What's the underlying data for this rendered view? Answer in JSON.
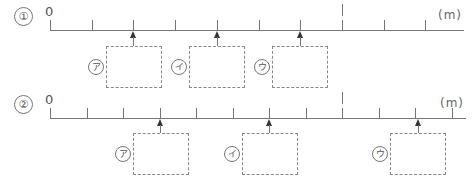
{
  "problems": [
    {
      "number": "①",
      "zero_label": "0",
      "unit": "(m)",
      "axis": {
        "x_start": 50,
        "x_end": 464,
        "y": 30
      },
      "ticks": [
        50,
        92,
        133,
        175,
        217,
        259,
        300,
        342,
        384,
        425
      ],
      "major_tick": 342,
      "blanks": [
        {
          "label": "ア",
          "arrow_x": 133,
          "box": {
            "x": 106,
            "y": 46,
            "w": 56,
            "h": 42
          },
          "label_x": 88
        },
        {
          "label": "イ",
          "arrow_x": 217,
          "box": {
            "x": 189,
            "y": 46,
            "w": 56,
            "h": 42
          },
          "label_x": 171
        },
        {
          "label": "ウ",
          "arrow_x": 300,
          "box": {
            "x": 272,
            "y": 46,
            "w": 56,
            "h": 42
          },
          "label_x": 254
        }
      ]
    },
    {
      "number": "②",
      "zero_label": "0",
      "unit": "(m)",
      "axis": {
        "x_start": 50,
        "x_end": 466,
        "y": 118
      },
      "ticks": [
        50,
        87,
        123,
        160,
        196,
        233,
        269,
        306,
        342,
        379,
        415,
        452
      ],
      "major_tick": 342,
      "blanks": [
        {
          "label": "ア",
          "arrow_x": 160,
          "box": {
            "x": 133,
            "y": 133,
            "w": 56,
            "h": 42
          },
          "label_x": 115
        },
        {
          "label": "イ",
          "arrow_x": 269,
          "box": {
            "x": 242,
            "y": 133,
            "w": 56,
            "h": 42
          },
          "label_x": 224
        },
        {
          "label": "ウ",
          "arrow_x": 418,
          "box": {
            "x": 390,
            "y": 133,
            "w": 56,
            "h": 42
          },
          "label_x": 372
        }
      ]
    }
  ]
}
